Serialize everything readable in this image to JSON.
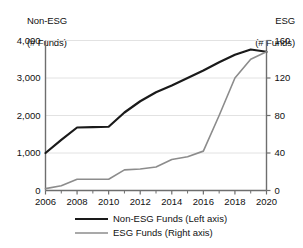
{
  "chart_data": {
    "type": "line",
    "title": "",
    "xlabel": "",
    "ylabel": "Non-ESG (# Funds)",
    "y2label": "ESG (# Funds)",
    "left_axis_title_line1": "Non-ESG",
    "left_axis_title_line2": "(# Funds)",
    "right_axis_title_line1": "ESG",
    "right_axis_title_line2": "(# Funds)",
    "grid": true,
    "legend_position": "bottom",
    "x": [
      2006,
      2007,
      2008,
      2009,
      2010,
      2011,
      2012,
      2013,
      2014,
      2015,
      2016,
      2017,
      2018,
      2019,
      2020
    ],
    "xlim": [
      2006,
      2020
    ],
    "xtick_labels": [
      "2006",
      "2008",
      "2010",
      "2012",
      "2014",
      "2016",
      "2018",
      "2020"
    ],
    "xtick_values": [
      2006,
      2008,
      2010,
      2012,
      2014,
      2016,
      2018,
      2020
    ],
    "xminor_values": [
      2007,
      2009,
      2011,
      2013,
      2015,
      2017,
      2019
    ],
    "ylim": [
      0,
      4000
    ],
    "ytick_labels": [
      "0",
      "1,000",
      "2,000",
      "3,000",
      "4,000"
    ],
    "ytick_values": [
      0,
      1000,
      2000,
      3000,
      4000
    ],
    "y2lim": [
      0,
      160
    ],
    "y2tick_labels": [
      "0",
      "40",
      "80",
      "120",
      "160"
    ],
    "y2tick_values": [
      0,
      40,
      80,
      120,
      160
    ],
    "series": [
      {
        "name": "Non-ESG Funds (Left axis)",
        "axis": "left",
        "color": "#1a1a1a",
        "width": 2.2,
        "values": [
          1000,
          1350,
          1680,
          1690,
          1700,
          2080,
          2380,
          2620,
          2800,
          3000,
          3200,
          3420,
          3620,
          3760,
          3700
        ]
      },
      {
        "name": "ESG Funds (Right axis)",
        "axis": "right",
        "color": "#8c8c8c",
        "width": 1.6,
        "values": [
          2,
          5,
          12,
          12,
          12,
          22,
          23,
          25,
          33,
          36,
          42,
          80,
          120,
          140,
          148
        ]
      }
    ],
    "legend": [
      {
        "label": "Non-ESG Funds (Left axis)",
        "color": "#1a1a1a",
        "width": 2.2
      },
      {
        "label": "ESG Funds (Right axis)",
        "color": "#8c8c8c",
        "width": 1.6
      }
    ],
    "colors": {
      "axis": "#6e6e6e",
      "grid": "#e2e2e2",
      "text": "#111111",
      "non_esg": "#1a1a1a",
      "esg": "#8c8c8c"
    }
  }
}
